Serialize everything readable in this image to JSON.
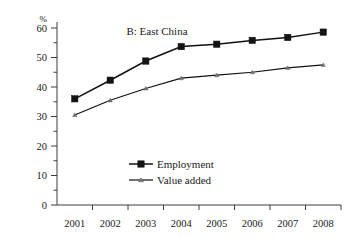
{
  "chart_data": {
    "type": "line",
    "title": "B: East China",
    "unit_label": "%",
    "xlabel": "",
    "ylabel": "",
    "ylim": [
      0,
      60
    ],
    "yticks": [
      0,
      10,
      20,
      30,
      40,
      50,
      60
    ],
    "grid": false,
    "legend_position": "center-bottom-inside",
    "categories": [
      "2001",
      "2002",
      "2003",
      "2004",
      "2005",
      "2006",
      "2007",
      "2008"
    ],
    "series": [
      {
        "name": "Employment",
        "marker": "filled-square",
        "values": [
          36.0,
          42.3,
          48.8,
          53.7,
          54.5,
          55.8,
          56.8,
          58.6
        ]
      },
      {
        "name": "Value added",
        "marker": "small-triangle",
        "values": [
          30.5,
          35.5,
          39.5,
          43.0,
          44.0,
          45.0,
          46.5,
          47.5
        ]
      }
    ]
  },
  "colors": {
    "axis": "#3c3c3c",
    "employment": "#141414",
    "value_added": "#111111",
    "background": "#ffffff"
  }
}
